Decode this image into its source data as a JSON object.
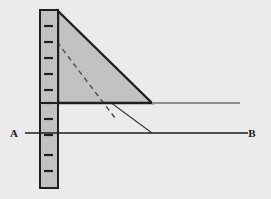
{
  "figure": {
    "name": "cantilever-triangular-load-diagram",
    "background_color": "#ebebeb",
    "stroke_color": "#1f1f1f",
    "fill_color": "#c2c2c2",
    "secondary_line_color": "#8f8f8f",
    "width": 271,
    "height": 199
  },
  "labels": {
    "left": "A",
    "right": "B"
  },
  "column": {
    "name": "vertical-scale-bar",
    "x": 40,
    "y": 10,
    "width": 18,
    "height": 178,
    "fill": "#c2c2c2",
    "stroke": "#1f1f1f",
    "tick_count": 10,
    "tick_positions": [
      26,
      42,
      58,
      74,
      90,
      103,
      119,
      135,
      155,
      171
    ],
    "tick_length": 9,
    "tick_color": "#1f1f1f"
  },
  "triangle": {
    "name": "triangular-load-region",
    "apex": {
      "x": 58,
      "y": 11
    },
    "base_left": {
      "x": 58,
      "y": 103
    },
    "base_right": {
      "x": 152,
      "y": 103
    },
    "fill": "#c2c2c2",
    "stroke": "#1f1f1f",
    "stroke_width": 2.4
  },
  "dashed_line": {
    "name": "dashed-reference-line",
    "x1": 57,
    "y1": 42,
    "x2": 115,
    "y2": 118,
    "stroke": "#4a4a4a",
    "dash": "5 4",
    "stroke_width": 1.4
  },
  "upper_line": {
    "name": "upper-horizontal-line",
    "y": 103,
    "solid_x1": 40,
    "solid_x2": 152,
    "light_x1": 152,
    "light_x2": 240,
    "stroke": "#1f1f1f",
    "light_stroke": "#8f8f8f",
    "stroke_width": 1.8
  },
  "base_line": {
    "name": "baseline-a-b",
    "y": 133,
    "x1": 25,
    "x2": 248,
    "stroke": "#1f1f1f",
    "stroke_width": 1.6
  },
  "thin_diagonal": {
    "name": "thin-diagonal-connector",
    "x1": 110,
    "y1": 102,
    "x2": 152,
    "y2": 133,
    "stroke": "#3a3a3a",
    "stroke_width": 1.1
  },
  "label_positions": {
    "a": {
      "x": 14,
      "y": 137
    },
    "b": {
      "x": 252,
      "y": 137
    }
  }
}
